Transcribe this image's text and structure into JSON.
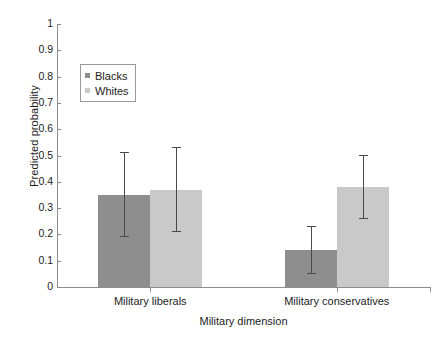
{
  "chart_data": {
    "type": "bar",
    "title": "",
    "xlabel": "Military dimension",
    "ylabel": "Predicted probability",
    "categories": [
      "Military liberals",
      "Military conservatives"
    ],
    "ylim": [
      0,
      1
    ],
    "yticks": [
      "0",
      "0.1",
      "0.2",
      "0.3",
      "0.4",
      "0.5",
      "0.6",
      "0.7",
      "0.8",
      "0.9",
      "1"
    ],
    "grid": false,
    "legend_position": "upper-left-inside",
    "series": [
      {
        "name": "Blacks",
        "color": "#8e8e8e",
        "values": [
          0.35,
          0.14
        ],
        "error_low": [
          0.19,
          0.05
        ],
        "error_high": [
          0.51,
          0.23
        ]
      },
      {
        "name": "Whites",
        "color": "#c9c9c9",
        "values": [
          0.37,
          0.38
        ],
        "error_low": [
          0.21,
          0.26
        ],
        "error_high": [
          0.53,
          0.5
        ]
      }
    ],
    "errorbar_color": "#4a4a4a",
    "axis_color": "#8d8d8d"
  }
}
